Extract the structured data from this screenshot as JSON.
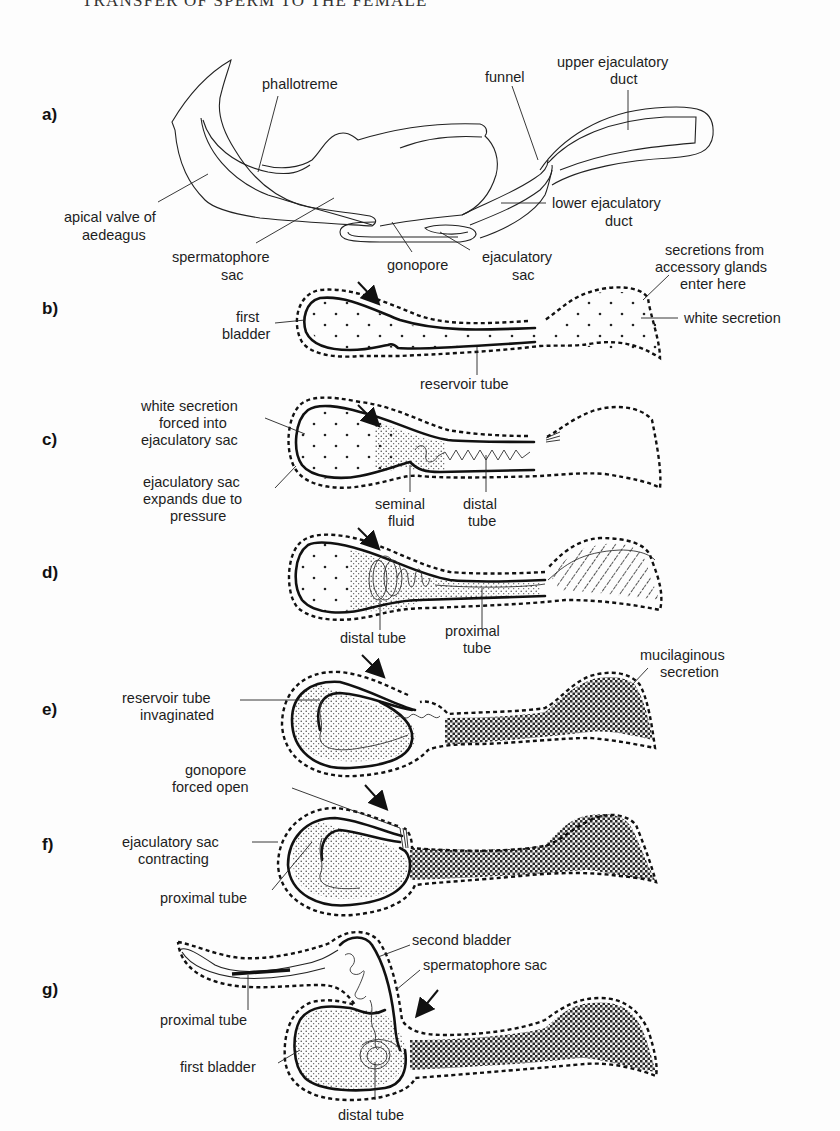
{
  "page": {
    "running_head": "TRANSFER OF SPERM TO THE FEMALE"
  },
  "panels": {
    "a": {
      "letter": "a)",
      "labels": {
        "phallotreme": "phallotreme",
        "funnel": "funnel",
        "upper_duct_line1": "upper ejaculatory",
        "upper_duct_line2": "duct",
        "apical_line1": "apical valve of",
        "apical_line2": "aedeagus",
        "lower_duct_line1": "lower ejaculatory",
        "lower_duct_line2": "duct",
        "spermatophore_line1": "spermatophore",
        "spermatophore_line2": "sac",
        "gonopore": "gonopore",
        "ejac_sac_line1": "ejaculatory",
        "ejac_sac_line2": "sac"
      }
    },
    "b": {
      "letter": "b)",
      "labels": {
        "secretions_line1": "secretions from",
        "secretions_line2": "accessory glands",
        "secretions_line3": "enter here",
        "first_bladder_line1": "first",
        "first_bladder_line2": "bladder",
        "white_secretion": "white secretion",
        "reservoir_tube": "reservoir tube"
      }
    },
    "c": {
      "letter": "c)",
      "labels": {
        "white_forced_line1": "white secretion",
        "white_forced_line2": "forced into",
        "white_forced_line3": "ejaculatory sac",
        "expands_line1": "ejaculatory sac",
        "expands_line2": "expands due to",
        "expands_line3": "pressure",
        "seminal_line1": "seminal",
        "seminal_line2": "fluid",
        "distal_line1": "distal",
        "distal_line2": "tube"
      }
    },
    "d": {
      "letter": "d)",
      "labels": {
        "distal_tube": "distal tube",
        "proximal_line1": "proximal",
        "proximal_line2": "tube"
      }
    },
    "e": {
      "letter": "e)",
      "labels": {
        "mucilaginous_line1": "mucilaginous",
        "mucilaginous_line2": "secretion",
        "reservoir_inv_line1": "reservoir tube",
        "reservoir_inv_line2": "invaginated"
      }
    },
    "f": {
      "letter": "f)",
      "labels": {
        "gonopore_line1": "gonopore",
        "gonopore_line2": "forced open",
        "contracting_line1": "ejaculatory sac",
        "contracting_line2": "contracting",
        "proximal_tube": "proximal tube"
      }
    },
    "g": {
      "letter": "g)",
      "labels": {
        "second_bladder": "second bladder",
        "spermatophore_sac": "spermatophore sac",
        "proximal_tube": "proximal tube",
        "first_bladder": "first bladder",
        "distal_tube": "distal tube"
      }
    }
  },
  "colors": {
    "ink": "#111111",
    "paper": "#fdfdfd"
  }
}
